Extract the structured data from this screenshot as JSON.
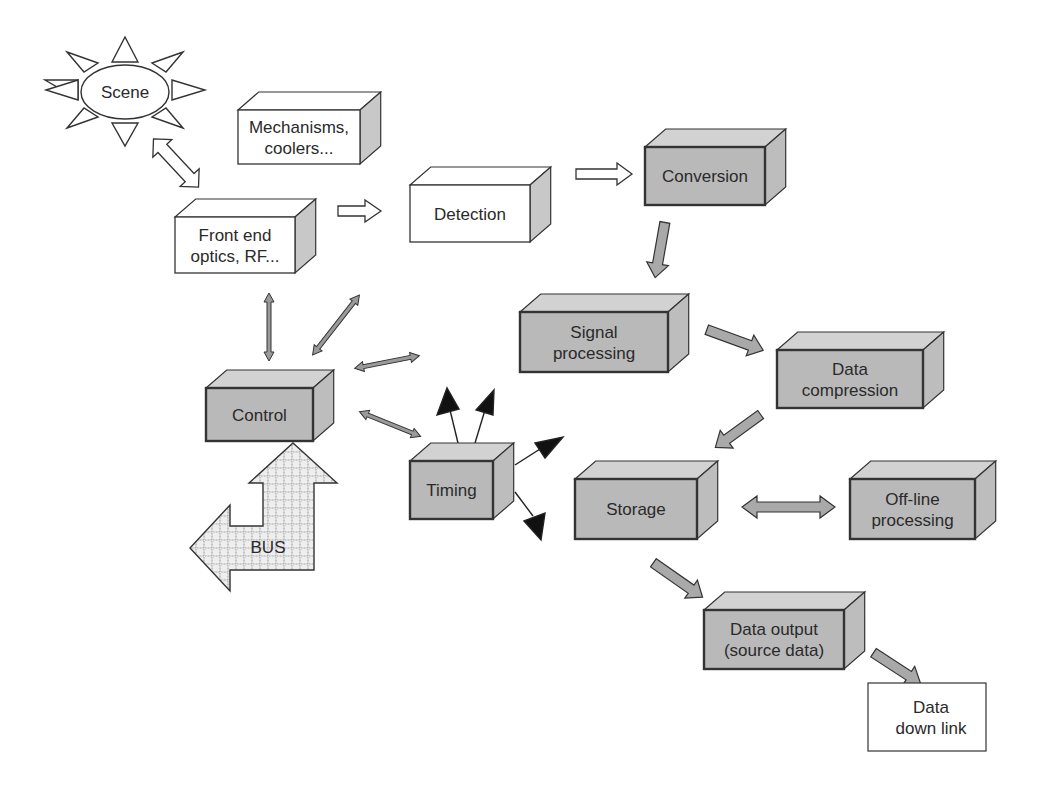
{
  "diagram": {
    "type": "system block diagram",
    "colors": {
      "shaded_front": "#b9b9b9",
      "shaded_top": "#d2d2d2",
      "shaded_side": "#bdbdbd",
      "white_front": "#ffffff",
      "white_side": "#c8c8c8",
      "outline": "#333333",
      "arrow_gray": "#a9a9a9",
      "arrow_black": "#111111",
      "bus_fill": "#e6e6e6"
    },
    "scene": {
      "label": "Scene"
    },
    "bus": {
      "label": "BUS"
    },
    "blocks": [
      {
        "id": "mechanisms",
        "lines": [
          "Mechanisms,",
          "coolers..."
        ],
        "x": 238,
        "y": 110,
        "w": 122,
        "h": 54,
        "d": 18,
        "shaded": false
      },
      {
        "id": "front-end",
        "lines": [
          "Front end",
          "optics, RF..."
        ],
        "x": 175,
        "y": 217,
        "w": 120,
        "h": 56,
        "d": 18,
        "shaded": false
      },
      {
        "id": "detection",
        "lines": [
          "Detection"
        ],
        "x": 410,
        "y": 185,
        "w": 120,
        "h": 57,
        "d": 18,
        "shaded": false
      },
      {
        "id": "conversion",
        "lines": [
          "Conversion"
        ],
        "x": 645,
        "y": 147,
        "w": 120,
        "h": 58,
        "d": 18,
        "shaded": true
      },
      {
        "id": "signal-processing",
        "lines": [
          "Signal",
          "processing"
        ],
        "x": 520,
        "y": 312,
        "w": 148,
        "h": 60,
        "d": 18,
        "shaded": true
      },
      {
        "id": "data-compression",
        "lines": [
          "Data",
          "compression"
        ],
        "x": 777,
        "y": 350,
        "w": 146,
        "h": 58,
        "d": 18,
        "shaded": true
      },
      {
        "id": "control",
        "lines": [
          "Control"
        ],
        "x": 206,
        "y": 388,
        "w": 107,
        "h": 53,
        "d": 18,
        "shaded": true
      },
      {
        "id": "timing",
        "lines": [
          "Timing"
        ],
        "x": 410,
        "y": 461,
        "w": 83,
        "h": 58,
        "d": 18,
        "shaded": true
      },
      {
        "id": "storage",
        "lines": [
          "Storage"
        ],
        "x": 575,
        "y": 479,
        "w": 122,
        "h": 60,
        "d": 18,
        "shaded": true
      },
      {
        "id": "offline-processing",
        "lines": [
          "Off-line",
          "processing"
        ],
        "x": 850,
        "y": 479,
        "w": 125,
        "h": 60,
        "d": 18,
        "shaded": true
      },
      {
        "id": "data-output",
        "lines": [
          "Data output",
          "(source data)"
        ],
        "x": 704,
        "y": 610,
        "w": 140,
        "h": 59,
        "d": 18,
        "shaded": true
      }
    ],
    "plain_boxes": [
      {
        "id": "data-down-link",
        "lines": [
          "Data",
          "down link"
        ],
        "x": 868,
        "y": 683,
        "w": 118,
        "h": 68
      }
    ],
    "connections": [
      {
        "from": "scene",
        "to": "front-end",
        "style": "hollow-double"
      },
      {
        "from": "front-end",
        "to": "detection",
        "style": "hollow"
      },
      {
        "from": "detection",
        "to": "conversion",
        "style": "hollow"
      },
      {
        "from": "conversion",
        "to": "signal-processing",
        "style": "gray"
      },
      {
        "from": "signal-processing",
        "to": "data-compression",
        "style": "gray"
      },
      {
        "from": "data-compression",
        "to": "storage",
        "style": "gray"
      },
      {
        "from": "storage",
        "to": "offline-processing",
        "style": "gray-double"
      },
      {
        "from": "storage",
        "to": "data-output",
        "style": "gray"
      },
      {
        "from": "data-output",
        "to": "data-down-link",
        "style": "gray"
      },
      {
        "from": "control",
        "to": "front-end",
        "style": "thin-double"
      },
      {
        "from": "control",
        "to": "detection",
        "style": "thin-double"
      },
      {
        "from": "control",
        "to": "signal-processing",
        "style": "thin-double"
      },
      {
        "from": "control",
        "to": "timing",
        "style": "thin-double"
      },
      {
        "from": "bus",
        "to": "control",
        "style": "bus-arrow"
      },
      {
        "from": "timing",
        "to": "outputs",
        "style": "black-pointer",
        "count": 4
      }
    ]
  }
}
